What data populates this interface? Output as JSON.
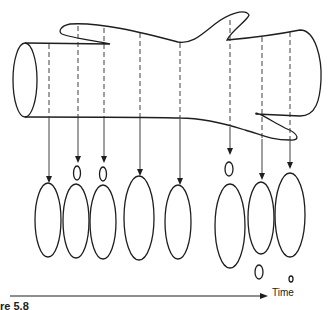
{
  "figure": {
    "axis_label": "Time",
    "caption_partial": "re 5.8",
    "colors": {
      "line": "#1e1e1e",
      "background": "#ffffff"
    }
  },
  "branching_object": {
    "description": "Tubular branching object with open end cap at left, one upper-left branch, one upper-right branch, one lower-right branch",
    "slice_positions_x": [
      49,
      78,
      104,
      140,
      180,
      230,
      262,
      290
    ]
  },
  "cross_sections": [
    {
      "index": 1,
      "cx": 48,
      "cy": 220,
      "rx": 13,
      "ry": 37,
      "satellites": []
    },
    {
      "index": 2,
      "cx": 76,
      "cy": 221,
      "rx": 13,
      "ry": 37,
      "satellites": [
        {
          "cx": 77,
          "cy": 173,
          "rx": 3.5,
          "ry": 7
        }
      ]
    },
    {
      "index": 3,
      "cx": 103,
      "cy": 222,
      "rx": 13,
      "ry": 37,
      "satellites": [
        {
          "cx": 103,
          "cy": 174,
          "rx": 3.5,
          "ry": 7
        }
      ]
    },
    {
      "index": 4,
      "cx": 139,
      "cy": 218,
      "rx": 15,
      "ry": 42,
      "satellites": []
    },
    {
      "index": 5,
      "cx": 178,
      "cy": 222,
      "rx": 13,
      "ry": 37,
      "satellites": []
    },
    {
      "index": 6,
      "cx": 230,
      "cy": 226,
      "rx": 15,
      "ry": 42,
      "satellites": [
        {
          "cx": 229,
          "cy": 169,
          "rx": 4,
          "ry": 7
        }
      ]
    },
    {
      "index": 7,
      "cx": 261,
      "cy": 218,
      "rx": 13,
      "ry": 36,
      "satellites": [
        {
          "cx": 259,
          "cy": 272,
          "rx": 4,
          "ry": 7
        }
      ]
    },
    {
      "index": 8,
      "cx": 290,
      "cy": 215,
      "rx": 15,
      "ry": 42,
      "satellites": [
        {
          "cx": 291,
          "cy": 279,
          "rx": 2,
          "ry": 3
        }
      ]
    }
  ]
}
